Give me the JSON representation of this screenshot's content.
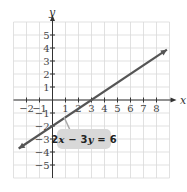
{
  "chart_data": {
    "type": "line",
    "title": "",
    "xlabel": "x",
    "ylabel": "y",
    "xlim": [
      -3,
      9
    ],
    "ylim": [
      -6,
      6
    ],
    "grid": true,
    "x_ticks": [
      "-2",
      "-1",
      "1",
      "2",
      "3",
      "4",
      "5",
      "6",
      "7",
      "8"
    ],
    "y_ticks": [
      "5",
      "4",
      "3",
      "2",
      "1",
      "-1",
      "-2",
      "-3",
      "-4",
      "-5"
    ],
    "series": [
      {
        "name": "2x − 3y = 6",
        "equation": "2x - 3y = 6",
        "slope": 0.6667,
        "intercept": -2,
        "x": [
          -2.6,
          0,
          3,
          8.8
        ],
        "y": [
          -3.73,
          -2,
          0,
          3.87
        ],
        "arrows": "both"
      }
    ],
    "annotation": {
      "text": "2x − 3y = 6",
      "points_to": "line"
    },
    "legend": "none"
  },
  "labels": {
    "x_axis": "x",
    "y_axis": "y",
    "equation_prefix": "2",
    "equation_x": "x",
    "equation_mid": " − 3",
    "equation_y": "y",
    "equation_suffix": " = 6"
  },
  "colors": {
    "line": "#555555",
    "grid": "#d9d9d9",
    "axis": "#333333",
    "label_box": "#d8d8d8"
  }
}
